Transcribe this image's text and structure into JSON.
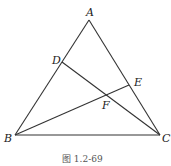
{
  "diagram": {
    "points": {
      "A": {
        "label": "A",
        "x": 89,
        "y": 20
      },
      "B": {
        "label": "B",
        "x": 15,
        "y": 135
      },
      "C": {
        "label": "C",
        "x": 160,
        "y": 135
      },
      "D": {
        "label": "D",
        "x": 62,
        "y": 62
      },
      "E": {
        "label": "E",
        "x": 129,
        "y": 85
      },
      "F": {
        "label": "F",
        "x": 107,
        "y": 96
      }
    },
    "segments": [
      "AB",
      "AC",
      "BC",
      "DC",
      "BE"
    ],
    "caption": "图 1.2-69"
  }
}
